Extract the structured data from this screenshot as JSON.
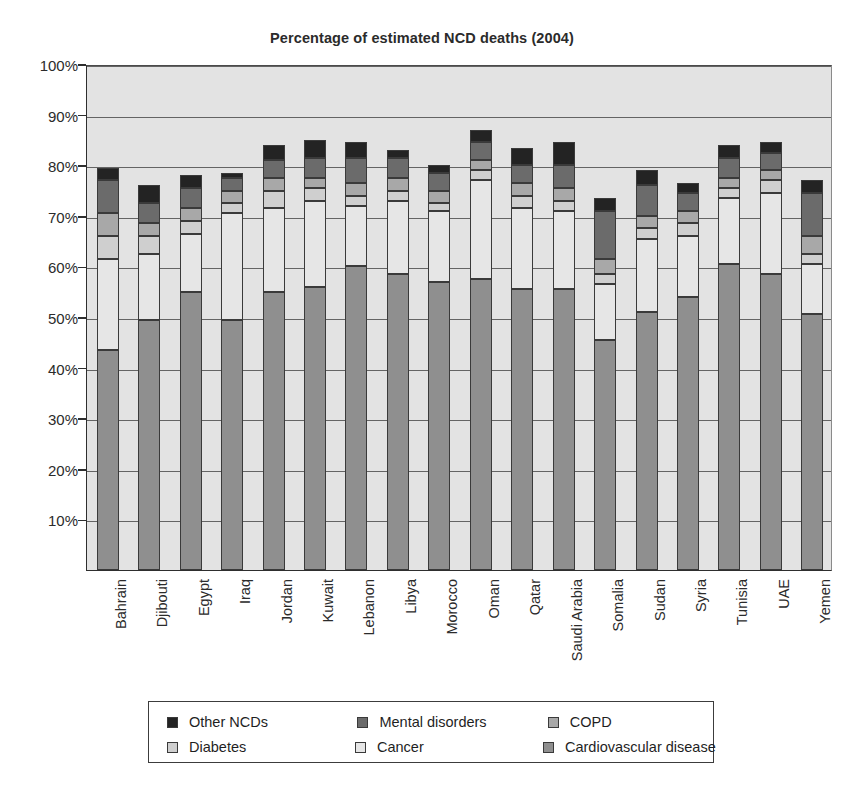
{
  "chart_data": {
    "type": "bar",
    "subtype": "stacked-bar-100-percent",
    "title": "Percentage of estimated NCD deaths (2004)",
    "xlabel": "",
    "ylabel": "",
    "ylim": [
      0,
      100
    ],
    "y_tick_labels": [
      "10%",
      "20%",
      "30%",
      "40%",
      "50%",
      "60%",
      "70%",
      "80%",
      "90%",
      "100%"
    ],
    "y_tick_values": [
      10,
      20,
      30,
      40,
      50,
      60,
      70,
      80,
      90,
      100
    ],
    "grid": true,
    "legend_position": "bottom",
    "categories": [
      "Bahrain",
      "Djibouti",
      "Egypt",
      "Iraq",
      "Jordan",
      "Kuwait",
      "Lebanon",
      "Libya",
      "Morocco",
      "Oman",
      "Qatar",
      "Saudi Arabia",
      "Somalia",
      "Sudan",
      "Syria",
      "Tunisia",
      "UAE",
      "Yemen"
    ],
    "stack_order_bottom_to_top": [
      "Cardiovascular disease",
      "Cancer",
      "Diabetes",
      "COPD",
      "Mental disorders",
      "Other NCDs"
    ],
    "series": [
      {
        "name": "Cardiovascular disease",
        "color": "#8f8f8f",
        "values": [
          43.5,
          49.5,
          55.0,
          49.5,
          55.0,
          56.0,
          60.0,
          58.5,
          57.0,
          57.5,
          55.5,
          55.5,
          45.5,
          51.0,
          54.0,
          60.5,
          58.5,
          50.5
        ]
      },
      {
        "name": "Cancer",
        "color": "#e6e6e6",
        "values": [
          18.0,
          13.0,
          11.5,
          21.0,
          16.5,
          17.0,
          12.0,
          14.5,
          14.0,
          19.5,
          16.0,
          15.5,
          11.0,
          14.5,
          12.0,
          13.0,
          16.0,
          10.0
        ]
      },
      {
        "name": "Diabetes",
        "color": "#cfcfcf",
        "values": [
          4.5,
          3.5,
          2.5,
          2.0,
          3.5,
          2.5,
          2.0,
          2.0,
          1.5,
          2.0,
          2.5,
          2.0,
          2.0,
          2.0,
          2.5,
          2.0,
          2.5,
          2.0
        ]
      },
      {
        "name": "COPD",
        "color": "#a8a8a8",
        "values": [
          4.5,
          2.5,
          2.5,
          2.5,
          2.5,
          2.0,
          2.5,
          2.5,
          2.5,
          2.0,
          2.5,
          2.5,
          3.0,
          2.5,
          2.5,
          2.0,
          2.0,
          3.5
        ]
      },
      {
        "name": "Mental disorders",
        "color": "#6b6b6b",
        "values": [
          6.5,
          4.0,
          4.0,
          2.5,
          3.5,
          4.0,
          5.0,
          4.0,
          3.5,
          3.5,
          3.5,
          4.5,
          9.5,
          6.0,
          3.5,
          4.0,
          3.5,
          8.5
        ]
      },
      {
        "name": "Other NCDs",
        "color": "#232323",
        "values": [
          2.5,
          3.5,
          2.5,
          1.0,
          3.0,
          3.5,
          3.0,
          1.5,
          1.5,
          2.5,
          3.5,
          4.5,
          2.5,
          3.0,
          2.0,
          2.5,
          2.0,
          2.5
        ]
      }
    ],
    "legend_entries": [
      {
        "label": "Other NCDs",
        "color": "#232323"
      },
      {
        "label": "Mental disorders",
        "color": "#6b6b6b"
      },
      {
        "label": "COPD",
        "color": "#a8a8a8"
      },
      {
        "label": "Diabetes",
        "color": "#cfcfcf"
      },
      {
        "label": "Cancer",
        "color": "#e6e6e6"
      },
      {
        "label": "Cardiovascular disease",
        "color": "#8f8f8f"
      }
    ]
  }
}
